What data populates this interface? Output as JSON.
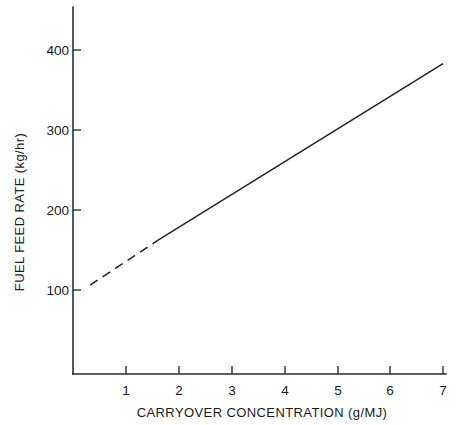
{
  "chart_data": {
    "type": "line",
    "title": "",
    "xlabel": "CARRYOVER CONCENTRATION (g/MJ)",
    "ylabel": "FUEL FEED RATE (kg/hr)",
    "xlim": [
      0.0,
      7.06
    ],
    "ylim": [
      0,
      430
    ],
    "grid": false,
    "legend": "none",
    "x_ticks": [
      1,
      2,
      3,
      4,
      5,
      6,
      7
    ],
    "x_tick_labels": [
      "1",
      "2",
      "3",
      "4",
      "5",
      "6",
      "7"
    ],
    "y_ticks": [
      100,
      200,
      300,
      400
    ],
    "y_tick_labels": [
      "100",
      "200",
      "300",
      "400"
    ],
    "series": [
      {
        "name": "extrapolated",
        "style": "dashed",
        "color": "#232323",
        "x": [
          0.32,
          1.6
        ],
        "values": [
          106,
          162
        ]
      },
      {
        "name": "measured",
        "style": "solid",
        "color": "#232323",
        "x": [
          1.6,
          7.0
        ],
        "values": [
          162,
          383
        ]
      }
    ]
  },
  "axes": {
    "x_tick_0": "1",
    "x_tick_1": "2",
    "x_tick_2": "3",
    "x_tick_3": "4",
    "x_tick_4": "5",
    "x_tick_5": "6",
    "x_tick_6": "7",
    "y_tick_0": "100",
    "y_tick_1": "200",
    "y_tick_2": "300",
    "y_tick_3": "400",
    "x_axis_title": "CARRYOVER CONCENTRATION (g/MJ)",
    "y_axis_title": "FUEL FEED RATE (kg/hr)"
  }
}
